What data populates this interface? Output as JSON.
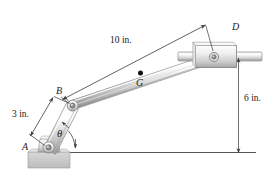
{
  "figure": {
    "type": "mechanism-diagram",
    "labels": {
      "dim_ten": "10 in.",
      "dim_three": "3 in.",
      "dim_six": "6 in.",
      "point_a": "A",
      "point_b": "B",
      "point_d": "D",
      "point_g": "G",
      "angle_theta": "θ"
    },
    "colors": {
      "line": "#3a3a3a",
      "metal_light": "#f2f2f2",
      "metal_mid": "#cfcfcf",
      "metal_dark": "#9a9a9a",
      "ground": "#c9c9c9",
      "text": "#1a1a1a"
    },
    "geometry": {
      "A": [
        48,
        147
      ],
      "B": [
        73,
        106
      ],
      "D": [
        212,
        60
      ],
      "G": [
        140,
        73
      ],
      "baseline_y": 152,
      "baseline_x0": 47,
      "baseline_x1": 256,
      "vertical_dim_x": 238,
      "vertical_dim_y0": 58,
      "vertical_dim_y1": 153
    }
  }
}
